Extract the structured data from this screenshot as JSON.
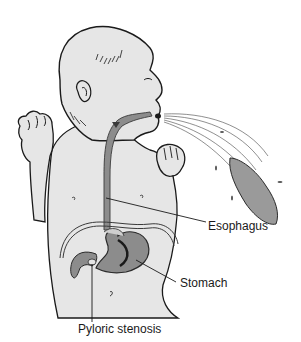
{
  "figure": {
    "labels": {
      "esophagus": "Esophagus",
      "stomach": "Stomach",
      "pyloric": "Pyloric stenosis"
    },
    "colors": {
      "skin": "#e6e6e6",
      "outline": "#1a1a1a",
      "organ": "#8c8c8c",
      "organ_dark": "#5a5a5a",
      "vomit": "#9a9a9a"
    }
  }
}
